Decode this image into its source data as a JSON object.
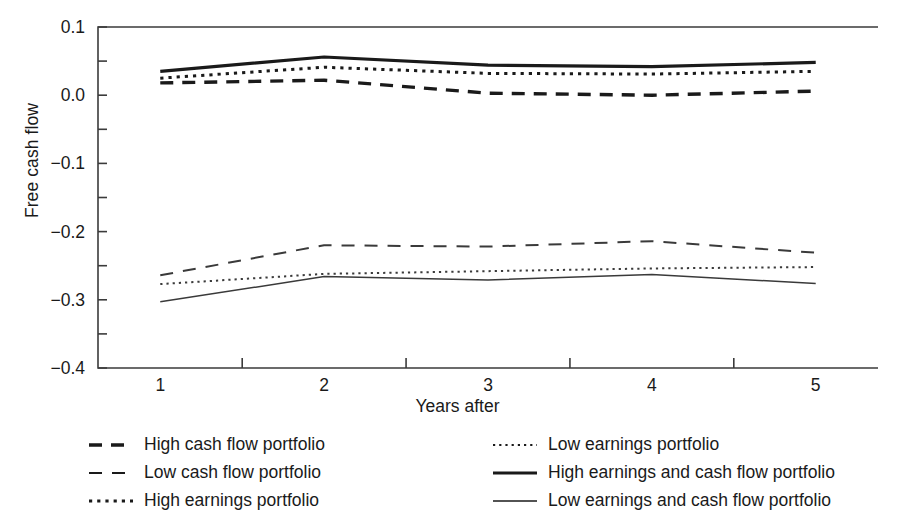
{
  "chart_data": {
    "type": "line",
    "title": "",
    "xlabel": "Years after",
    "ylabel": "Free cash flow",
    "x": [
      1,
      2,
      3,
      4,
      5
    ],
    "xtick_labels": [
      "1",
      "2",
      "3",
      "4",
      "5"
    ],
    "ytick_labels": [
      "0.1",
      "0.0",
      "-0.1",
      "-0.2",
      "-0.3",
      "-0.4"
    ],
    "ytick_values": [
      0.1,
      0.0,
      -0.1,
      -0.2,
      -0.3,
      -0.4
    ],
    "yminor_step": 0.05,
    "ylim": [
      -0.4,
      0.1
    ],
    "xlim": [
      0.62,
      5.38
    ],
    "grid": false,
    "legend_position": "below-plot-two-columns",
    "series": [
      {
        "name": "High cash flow portfolio",
        "style": "dashed-thick",
        "color": "#1a1a1a",
        "values": [
          0.018,
          0.022,
          0.003,
          0.0,
          0.006
        ]
      },
      {
        "name": "Low cash flow portfolio",
        "style": "dashed-thin",
        "color": "#3a3a3a",
        "values": [
          -0.264,
          -0.22,
          -0.222,
          -0.214,
          -0.231
        ]
      },
      {
        "name": "High earnings portfolio",
        "style": "dotted-medium",
        "color": "#1a1a1a",
        "values": [
          0.025,
          0.041,
          0.032,
          0.031,
          0.035
        ]
      },
      {
        "name": "Low earnings portfolio",
        "style": "dotted-fine",
        "color": "#3a3a3a",
        "values": [
          -0.277,
          -0.262,
          -0.258,
          -0.254,
          -0.252
        ]
      },
      {
        "name": "High earnings and cash flow portfolio",
        "style": "solid-thick",
        "color": "#1a1a1a",
        "values": [
          0.035,
          0.056,
          0.044,
          0.042,
          0.048
        ]
      },
      {
        "name": "Low earnings and cash flow portfolio",
        "style": "solid-thin",
        "color": "#3a3a3a",
        "values": [
          -0.303,
          -0.266,
          -0.271,
          -0.263,
          -0.276
        ]
      }
    ]
  },
  "axis": {
    "ylabel": "Free cash flow",
    "xlabel": "Years after"
  },
  "legend": {
    "left_column": [
      {
        "label": "High cash flow portfolio",
        "style": "dashed-thick"
      },
      {
        "label": "Low cash flow portfolio",
        "style": "dashed-thin"
      },
      {
        "label": "High earnings portfolio",
        "style": "dotted-medium"
      }
    ],
    "right_column": [
      {
        "label": "Low earnings portfolio",
        "style": "dotted-fine"
      },
      {
        "label": "High earnings and cash flow portfolio",
        "style": "solid-thick"
      },
      {
        "label": "Low earnings and cash flow portfolio",
        "style": "solid-thin"
      }
    ]
  }
}
